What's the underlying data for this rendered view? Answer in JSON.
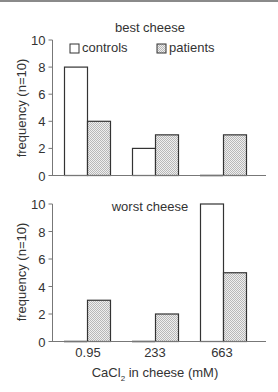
{
  "chart_data": [
    {
      "type": "bar",
      "title": "best cheese",
      "categories": [
        "0.95",
        "233",
        "663"
      ],
      "series": [
        {
          "name": "controls",
          "values": [
            8,
            2,
            0
          ]
        },
        {
          "name": "patients",
          "values": [
            4,
            3,
            3
          ]
        }
      ],
      "xlabel": "",
      "ylabel": "frequency (n=10)",
      "ylim": [
        0,
        10
      ],
      "yticks": [
        0,
        2,
        4,
        6,
        8,
        10
      ],
      "legend": {
        "position": "top",
        "entries": [
          "controls",
          "patients"
        ]
      },
      "grid": false
    },
    {
      "type": "bar",
      "title": "worst cheese",
      "categories": [
        "0.95",
        "233",
        "663"
      ],
      "series": [
        {
          "name": "controls",
          "values": [
            0,
            0,
            10
          ]
        },
        {
          "name": "patients",
          "values": [
            3,
            2,
            5
          ]
        }
      ],
      "xlabel": "CaCl2 in cheese (mM)",
      "ylabel": "frequency (n=10)",
      "ylim": [
        0,
        10
      ],
      "yticks": [
        0,
        2,
        4,
        6,
        8,
        10
      ],
      "grid": false
    }
  ],
  "top": {
    "title": "best cheese",
    "ylabel": "frequency (n=10)",
    "legend": {
      "controls": "controls",
      "patients": "patients"
    }
  },
  "bottom": {
    "title": "worst cheese",
    "ylabel": "frequency (n=10)",
    "xlabel_main": "CaCl",
    "xlabel_sub": "2",
    "xlabel_rest": " in cheese (mM)"
  },
  "ticks": {
    "y": [
      "0",
      "2",
      "4",
      "6",
      "8",
      "10"
    ],
    "x": [
      "0.95",
      "233",
      "663"
    ]
  },
  "colors": {
    "controls_fill": "#ffffff",
    "patients_fill": "#d9d9d9",
    "stroke": "#333333"
  }
}
